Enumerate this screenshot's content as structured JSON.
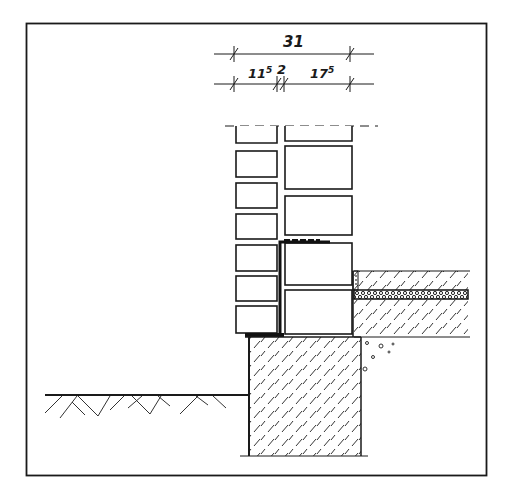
{
  "drawing": {
    "type": "architectural-section",
    "subject": "cavity wall base detail with foundation, floor slab and ground",
    "colors": {
      "line": "#1a1a1a",
      "background": "#ffffff",
      "hatch": "#333333"
    },
    "dimensions": {
      "overall": {
        "label": "31"
      },
      "segments": [
        {
          "label": "11",
          "sup": "5"
        },
        {
          "label": "2",
          "sup": ""
        },
        {
          "label": "17",
          "sup": "5"
        }
      ]
    }
  }
}
